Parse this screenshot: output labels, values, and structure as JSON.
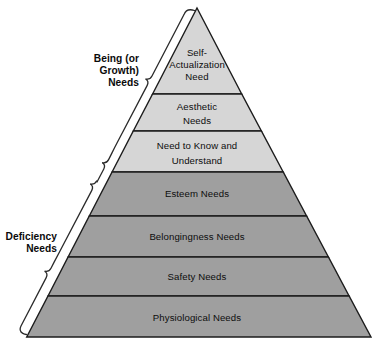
{
  "figure": {
    "background_color": "#ffffff",
    "outline_color": "#1c1c1c",
    "light_fill": "#d6d6d6",
    "dark_fill": "#9f9f9f"
  },
  "pyramid": {
    "tiers": [
      {
        "id": "self-actualization",
        "lines": [
          "Self-",
          "Actualization",
          "Need"
        ],
        "fill": "#d6d6d6",
        "group": "being"
      },
      {
        "id": "aesthetic",
        "lines": [
          "Aesthetic",
          "Needs"
        ],
        "fill": "#d6d6d6",
        "group": "being"
      },
      {
        "id": "need-to-know",
        "lines": [
          "Need to Know and",
          "Understand"
        ],
        "fill": "#d6d6d6",
        "group": "being"
      },
      {
        "id": "esteem",
        "lines": [
          "Esteem Needs"
        ],
        "fill": "#9f9f9f",
        "group": "deficiency"
      },
      {
        "id": "belongingness",
        "lines": [
          "Belongingness Needs"
        ],
        "fill": "#9f9f9f",
        "group": "deficiency"
      },
      {
        "id": "safety",
        "lines": [
          "Safety Needs"
        ],
        "fill": "#9f9f9f",
        "group": "deficiency"
      },
      {
        "id": "physiological",
        "lines": [
          "Physiological Needs"
        ],
        "fill": "#9f9f9f",
        "group": "deficiency"
      }
    ]
  },
  "groups": {
    "being": {
      "lines": [
        "Being (or",
        "Growth)",
        "Needs"
      ]
    },
    "deficiency": {
      "lines": [
        "Deficiency",
        "Needs"
      ]
    }
  }
}
